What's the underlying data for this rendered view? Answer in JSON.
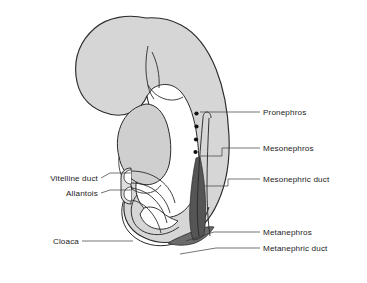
{
  "figure": {
    "background_color": "#ffffff",
    "width": 367,
    "height": 283
  },
  "palette": {
    "body_fill": "#d6d6d6",
    "body_fill_light": "#dedede",
    "organ_fill": "#cfcfcf",
    "tail_fill": "#c8c8c8",
    "mesonephros_dark": "#555555",
    "metanephros_dark": "#6b6b6b",
    "duct_white": "#ffffff",
    "outline": "#2b2b2b",
    "leader_line": "#3a3a3a",
    "text": "#1a1a1a",
    "dot_fill": "#111111"
  },
  "labels": {
    "left": [
      {
        "id": "vitelline-duct",
        "text": "Vitelline duct",
        "text_x": 98,
        "text_y": 181,
        "leader": "M 101,178 L 110,173 L 131,173"
      },
      {
        "id": "allantois",
        "text": "Allantois",
        "text_x": 98,
        "text_y": 196,
        "leader": "M 101,193 L 110,190 L 131,190"
      },
      {
        "id": "cloaca",
        "text": "Cloaca",
        "text_x": 79,
        "text_y": 244,
        "leader": "M 82,241 L 94,241 L 133,241"
      }
    ],
    "right": [
      {
        "id": "pronephros",
        "text": "Pronephros",
        "text_x": 263,
        "text_y": 114,
        "leader": "M 200,112 L 260,112"
      },
      {
        "id": "mesonephros",
        "text": "Mesonephros",
        "text_x": 263,
        "text_y": 150,
        "leader": "M 199,156 L 222,156 L 222,148 L 260,148"
      },
      {
        "id": "mesonephric-duct",
        "text": "Mesonephric duct",
        "text_x": 263,
        "text_y": 181,
        "leader": "M 205,186 L 228,186 L 228,179 L 260,179"
      },
      {
        "id": "metanephros",
        "text": "Metanephros",
        "text_x": 263,
        "text_y": 234,
        "leader": "M 186,241 L 214,232 L 260,232"
      },
      {
        "id": "metanephric-duct",
        "text": "Metanephric duct",
        "text_x": 263,
        "text_y": 250,
        "leader": "M 180,254 L 216,248 L 260,248"
      }
    ]
  },
  "structures": {
    "body_outline": "M 146,18 C 128,14 108,17 95,28 C 80,41 74,58 76,76 C 78,94 88,106 103,112 C 113,116 124,116 132,112 C 139,109 144,103 147,96 C 149,104 151,110 155,116 C 150,118 146,121 144,126 C 140,134 141,143 146,150 C 139,152 133,157 130,164 C 126,172 127,181 132,188 C 126,194 123,202 124,211 C 125,223 133,233 145,238 C 158,244 173,244 185,238 C 200,231 211,218 218,202 C 227,182 230,159 229,136 C 228,112 224,89 216,69 C 208,49 196,33 181,25 C 170,19 158,17 146,18 Z",
    "head_fill": "M 146,20 C 129,16 110,19 98,30 C 84,43 78,59 80,76 C 82,92 92,103 105,109 C 115,113 125,112 133,108 C 142,103 147,94 148,85 C 149,72 146,58 148,46 C 150,34 152,26 146,20 Z",
    "head_crease_1": "M 148,46 C 146,56 145,68 147,80 C 148,88 150,94 154,99",
    "head_crease_2": "M 152,52 C 157,62 160,75 159,88",
    "neck_notch": "M 148,85 C 152,92 158,97 165,99 C 172,101 178,100 183,97",
    "gut_fill": "M 146,104 C 136,106 128,112 123,121 C 117,132 116,145 119,157 C 121,167 126,175 133,180 C 140,185 148,186 155,183 C 162,180 167,173 169,165 C 172,152 171,137 167,124 C 163,112 156,104 146,104 Z",
    "gut_lower": "M 119,157 C 118,166 120,175 125,182 C 129,188 135,192 142,193 C 150,194 157,191 161,185",
    "tail_outer": "M 131,189 C 124,196 121,205 122,215 C 123,228 132,238 145,243 C 159,248 174,246 186,238 C 197,231 205,220 209,207",
    "tail_inner": "M 137,195 C 132,201 130,209 132,217 C 134,226 141,232 151,234 C 161,236 171,233 179,227",
    "cloaca_cavity": "M 140,214 C 142,222 149,228 158,229 C 166,230 173,227 178,221 C 172,219 166,216 162,212 C 156,207 150,206 144,208 Z",
    "mesonephros_band": "M 196,158 C 193,172 191,188 190,204 C 189,218 190,230 193,240 C 197,240 201,238 204,235 C 206,222 206,207 205,192 C 204,178 202,166 200,157 Z",
    "mesonephric_duct": "M 203,118 C 201,140 199,163 198,186 C 197,205 197,222 199,236",
    "mesonephric_duct_2": "M 209,118 C 208,140 207,163 207,186 C 207,205 208,222 210,236",
    "duct_cap": "M 203,118 C 203,114 205,112 207,112 C 209,112 211,114 211,118",
    "metanephros_blob": "M 168,243 C 176,246 186,246 195,243 C 203,240 210,234 214,227 C 208,226 201,228 194,231 C 185,235 176,238 168,243 Z",
    "vitelline_stalk": "M 131,170 C 127,170 124,173 124,177 C 124,181 127,184 131,184",
    "allantois_stalk": "M 131,187 C 127,187 124,190 124,194 C 124,198 127,201 131,201",
    "vitelline_tube_top": "M 131,171 C 142,171 152,174 160,180 C 168,186 173,194 175,203",
    "vitelline_tube_bot": "M 131,183 C 141,183 150,186 157,192 C 164,198 168,205 170,213",
    "allantois_tube_top": "M 131,188 C 140,189 148,193 154,199 C 161,206 165,214 167,223",
    "allantois_tube_bot": "M 131,200 C 138,201 145,205 150,211 C 156,218 159,225 161,233"
  },
  "pronephros_dots": [
    {
      "cx": 196.5,
      "cy": 113.5,
      "r": 2.1
    },
    {
      "cx": 196.5,
      "cy": 126.5,
      "r": 2.1
    },
    {
      "cx": 196.0,
      "cy": 139.5,
      "r": 2.1
    },
    {
      "cx": 195.5,
      "cy": 152.0,
      "r": 2.1
    }
  ]
}
